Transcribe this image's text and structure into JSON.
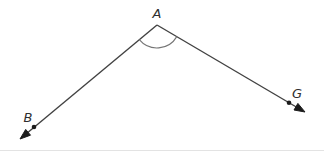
{
  "figure": {
    "type": "geometry-angle-diagram",
    "labels": {
      "vertex": "A",
      "left_point": "B",
      "right_point": "G"
    },
    "colors": {
      "ray": "#424242",
      "arc": "#757575",
      "point_dot": "#1c1c1c",
      "arrowhead": "#1c1c1c",
      "label_text": "#2e2e2e",
      "background": "#ffffff"
    }
  }
}
